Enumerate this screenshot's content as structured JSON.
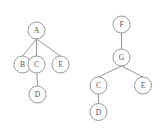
{
  "figure": {
    "background_color": "#ffffff",
    "stroke_color": "#8a8a8a",
    "label_color": "#555555",
    "node_radius": 8.5,
    "width": 163,
    "height": 130
  },
  "trees": [
    {
      "id": "left-tree",
      "name": "Tree 1",
      "root": "A",
      "nodes": [
        {
          "id": "L-A",
          "label": "A",
          "x": 36.5,
          "y": 30.5
        },
        {
          "id": "L-B",
          "label": "B",
          "x": 22.5,
          "y": 64.5
        },
        {
          "id": "L-C",
          "label": "C",
          "x": 36.5,
          "y": 64.5
        },
        {
          "id": "L-E",
          "label": "E",
          "x": 60.5,
          "y": 64.5
        },
        {
          "id": "L-D",
          "label": "D",
          "x": 37.5,
          "y": 94.5
        }
      ],
      "edges": [
        {
          "id": "L-A-B",
          "from": "L-A",
          "to": "L-B",
          "x1": 36.5,
          "y1": 39.0,
          "x2": 22.5,
          "y2": 56.0
        },
        {
          "id": "L-A-C",
          "from": "L-A",
          "to": "L-C",
          "x1": 36.5,
          "y1": 39.0,
          "x2": 36.5,
          "y2": 56.0
        },
        {
          "id": "L-A-E",
          "from": "L-A",
          "to": "L-E",
          "x1": 36.5,
          "y1": 39.0,
          "x2": 60.5,
          "y2": 56.0
        },
        {
          "id": "L-C-D",
          "from": "L-C",
          "to": "L-D",
          "x1": 36.8,
          "y1": 73.0,
          "x2": 37.5,
          "y2": 86.0
        }
      ]
    },
    {
      "id": "right-tree",
      "name": "Tree 2",
      "root": "F",
      "nodes": [
        {
          "id": "R-F",
          "label": "F",
          "x": 121.5,
          "y": 24.5
        },
        {
          "id": "R-G",
          "label": "G",
          "x": 121.5,
          "y": 57.5
        },
        {
          "id": "R-C",
          "label": "C",
          "x": 98.5,
          "y": 85.5
        },
        {
          "id": "R-E",
          "label": "E",
          "x": 143.0,
          "y": 85.5
        },
        {
          "id": "R-D",
          "label": "D",
          "x": 98.5,
          "y": 112.0
        }
      ],
      "edges": [
        {
          "id": "R-F-G",
          "from": "R-F",
          "to": "R-G",
          "x1": 121.5,
          "y1": 33.0,
          "x2": 121.5,
          "y2": 49.0
        },
        {
          "id": "R-G-C",
          "from": "R-G",
          "to": "R-C",
          "x1": 121.5,
          "y1": 66.0,
          "x2": 98.5,
          "y2": 77.0
        },
        {
          "id": "R-G-E",
          "from": "R-G",
          "to": "R-E",
          "x1": 121.5,
          "y1": 66.0,
          "x2": 143.0,
          "y2": 77.0
        },
        {
          "id": "R-C-D",
          "from": "R-C",
          "to": "R-D",
          "x1": 98.5,
          "y1": 94.0,
          "x2": 98.5,
          "y2": 103.5
        }
      ]
    }
  ]
}
